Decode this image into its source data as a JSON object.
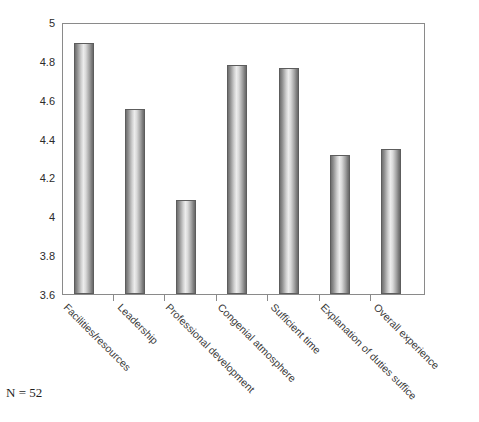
{
  "footnote": {
    "text": "N = 52"
  },
  "chart_data": {
    "type": "bar",
    "title": "",
    "subtitle": "",
    "xlabel": "",
    "ylabel": "",
    "ylim": [
      3.6,
      5
    ],
    "grid": false,
    "legend": false,
    "orientation": "vertical",
    "bar_style": "cylinder-gradient-grayscale",
    "categories": [
      "Facilities/resources",
      "Leadership",
      "Professional development",
      "Congenial atmosphere",
      "Sufficient time",
      "Explanation of duties suffice",
      "Overall experience"
    ],
    "values": [
      4.9,
      4.56,
      4.09,
      4.79,
      4.77,
      4.32,
      4.35
    ],
    "ytick_labels": [
      "5",
      "4.8",
      "4.6",
      "4.4",
      "4.2",
      "4",
      "3.8",
      "3.6"
    ],
    "ytick_values": [
      5,
      4.8,
      4.6,
      4.4,
      4.2,
      4,
      3.8,
      3.6
    ],
    "annotations": [
      "N = 52"
    ],
    "colors": {
      "bar_edge": "#5d5d5d",
      "bar_light": "#ececec",
      "bar_dark": "#6a6a6a",
      "axis": "#8a8a8a",
      "text": "#2b2b2b",
      "background": "#ffffff"
    }
  }
}
